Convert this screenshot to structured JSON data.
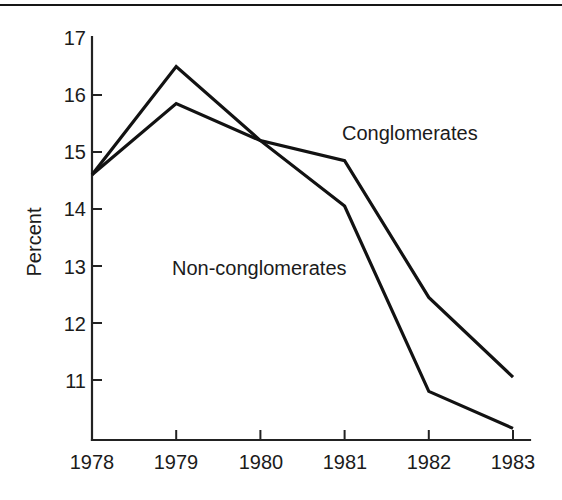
{
  "figure": {
    "background_color": "#ffffff",
    "line_color": "#121212",
    "axis_color": "#222222",
    "top_rule": "horizontal-rule"
  },
  "chart_data": {
    "type": "line",
    "title": "",
    "subtitle": "",
    "xlabel": "",
    "ylabel": "Percent",
    "x": [
      "1978",
      "1979",
      "1980",
      "1981",
      "1982",
      "1983"
    ],
    "categories": [
      "1978",
      "1979",
      "1980",
      "1981",
      "1982",
      "1983"
    ],
    "series": [
      {
        "name": "Conglomerates",
        "values": [
          14.6,
          16.5,
          15.2,
          14.85,
          12.45,
          11.05
        ],
        "label_position": "upper-right"
      },
      {
        "name": "Non-conglomerates",
        "values": [
          14.6,
          15.85,
          15.2,
          14.05,
          10.8,
          10.15
        ],
        "label_position": "middle-left"
      }
    ],
    "xlim": [
      "1978",
      "1983"
    ],
    "ylim": [
      10.0,
      17.0
    ],
    "ytick_labels": [
      "17",
      "16",
      "15",
      "14",
      "13",
      "12",
      "11"
    ],
    "ytick_values": [
      17,
      16,
      15,
      14,
      13,
      12,
      11
    ],
    "xtick_labels": [
      "1978",
      "1979",
      "1980",
      "1981",
      "1982",
      "1983"
    ],
    "grid": false,
    "legend": "inline-annotations",
    "annotations": [
      {
        "text": "Conglomerates",
        "series": "Conglomerates"
      },
      {
        "text": "Non-conglomerates",
        "series": "Non-conglomerates"
      }
    ]
  },
  "axes": {
    "y_axis_name": "Percent",
    "y_ticks": [
      {
        "label": "17",
        "value": 17
      },
      {
        "label": "16",
        "value": 16
      },
      {
        "label": "15",
        "value": 15
      },
      {
        "label": "14",
        "value": 14
      },
      {
        "label": "13",
        "value": 13
      },
      {
        "label": "12",
        "value": 12
      },
      {
        "label": "11",
        "value": 11
      }
    ],
    "x_ticks": [
      {
        "label": "1978"
      },
      {
        "label": "1979"
      },
      {
        "label": "1980"
      },
      {
        "label": "1981"
      },
      {
        "label": "1982"
      },
      {
        "label": "1983"
      }
    ]
  }
}
